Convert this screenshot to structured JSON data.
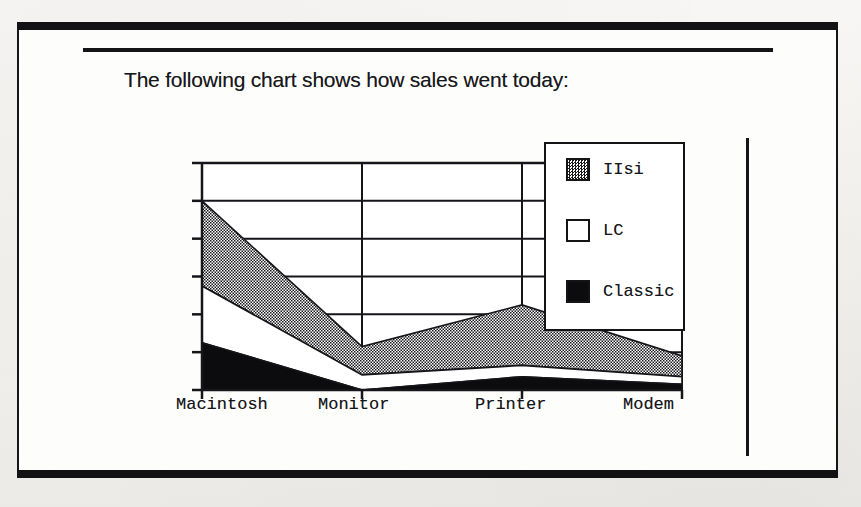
{
  "document": {
    "title_text": "The following chart shows how sales went today:",
    "frame_color": "#141417",
    "paper_color": "#fdfdfc"
  },
  "legend": {
    "position": "inside-top-right",
    "entries": [
      {
        "label": "IIsi",
        "swatch": "dotted-gray-pattern",
        "color": "#8a8a8a"
      },
      {
        "label": "LC",
        "swatch": "white-fill",
        "color": "#ffffff"
      },
      {
        "label": "Classic",
        "swatch": "solid-black",
        "color": "#0c0c0e"
      }
    ]
  },
  "chart_data": {
    "type": "area",
    "stacked": true,
    "title": "",
    "xlabel": "",
    "ylabel": "",
    "grid": true,
    "legend_position": "top-right",
    "categories": [
      "Macintosh",
      "Monitor",
      "Printer",
      "Modem"
    ],
    "ylim": [
      0,
      120
    ],
    "yticks": [
      0,
      20,
      40,
      60,
      80,
      100,
      120
    ],
    "ytick_labels": [
      "",
      "",
      "",
      "",
      "",
      "",
      ""
    ],
    "series": [
      {
        "name": "Classic",
        "values": [
          25,
          0,
          7,
          3
        ],
        "fill": "solid-black",
        "color": "#0c0c0e"
      },
      {
        "name": "LC",
        "values": [
          30,
          8,
          6,
          4
        ],
        "fill": "white-fill",
        "color": "#ffffff"
      },
      {
        "name": "IIsi",
        "values": [
          45,
          15,
          32,
          11
        ],
        "fill": "dotted-gray-pattern",
        "color": "#8a8a8a"
      }
    ],
    "stacked_tops": {
      "Classic": [
        25,
        0,
        7,
        3
      ],
      "LC": [
        55,
        8,
        13,
        7
      ],
      "IIsi": [
        100,
        23,
        45,
        18
      ]
    }
  },
  "axis": {
    "x_tick_labels": [
      "Macintosh",
      "Monitor",
      "Printer",
      "Modem"
    ],
    "y_tick_count": 7
  }
}
